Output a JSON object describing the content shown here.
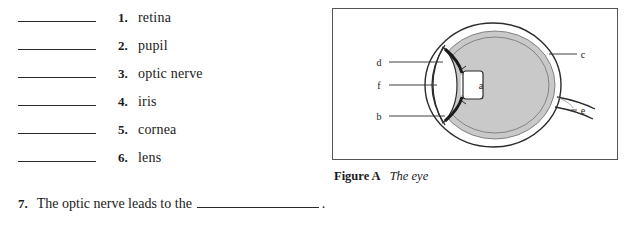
{
  "worksheet": {
    "match_items": [
      {
        "number": "1.",
        "label": "retina"
      },
      {
        "number": "2.",
        "label": "pupil"
      },
      {
        "number": "3.",
        "label": "optic nerve"
      },
      {
        "number": "4.",
        "label": "iris"
      },
      {
        "number": "5.",
        "label": "cornea"
      },
      {
        "number": "6.",
        "label": "lens"
      }
    ],
    "sentence": {
      "number": "7.",
      "before_blank": "The optic nerve leads to the",
      "after_blank": "."
    },
    "figure": {
      "caption_label": "Figure A",
      "caption_title": "The eye",
      "labels": [
        {
          "key": "a",
          "x": 148,
          "y": 76
        },
        {
          "key": "b",
          "x": 46,
          "y": 107
        },
        {
          "key": "c",
          "x": 250,
          "y": 45
        },
        {
          "key": "d",
          "x": 46,
          "y": 53
        },
        {
          "key": "e",
          "x": 250,
          "y": 101
        },
        {
          "key": "f",
          "x": 46,
          "y": 76
        }
      ]
    }
  }
}
